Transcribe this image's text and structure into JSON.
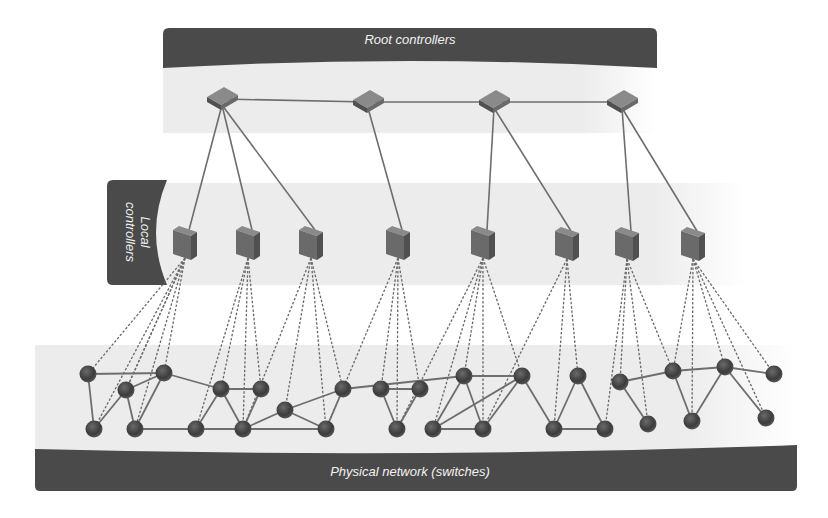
{
  "diagram": {
    "colors": {
      "band_dark": "#4a4a4a",
      "band_light": "#e9e9e9",
      "device_body": "#6a6a6a",
      "device_top": "#8a8a8a",
      "device_side": "#505050",
      "switch_fill": "#3f3f3f",
      "link_solid": "#6e6e6e",
      "link_dashed": "#6a6a6a",
      "label_text": "#f2f2f2"
    },
    "layers": {
      "root": {
        "label": "Root controllers",
        "band": {
          "x": 163,
          "y": 28,
          "w": 494,
          "h": 40
        },
        "area": {
          "x": 163,
          "y": 58,
          "w": 494,
          "h": 75
        },
        "nodes": [
          {
            "id": "r1",
            "x": 222,
            "y": 99
          },
          {
            "id": "r2",
            "x": 368,
            "y": 102
          },
          {
            "id": "r3",
            "x": 494,
            "y": 102
          },
          {
            "id": "r4",
            "x": 622,
            "y": 102
          }
        ]
      },
      "local": {
        "label_line1": "Local",
        "label_line2": "controllers",
        "band": {
          "x": 107,
          "y": 180,
          "w": 60,
          "h": 105
        },
        "area": {
          "x": 150,
          "y": 183,
          "w": 594,
          "h": 102
        },
        "nodes": [
          {
            "id": "l1",
            "x": 185,
            "y": 244
          },
          {
            "id": "l2",
            "x": 248,
            "y": 244
          },
          {
            "id": "l3",
            "x": 311,
            "y": 244
          },
          {
            "id": "l4",
            "x": 398,
            "y": 244
          },
          {
            "id": "l5",
            "x": 483,
            "y": 244
          },
          {
            "id": "l6",
            "x": 567,
            "y": 245
          },
          {
            "id": "l7",
            "x": 627,
            "y": 245
          },
          {
            "id": "l8",
            "x": 693,
            "y": 245
          }
        ]
      },
      "physical": {
        "label": "Physical network (switches)",
        "band": {
          "x": 35,
          "y": 445,
          "w": 762,
          "h": 46
        },
        "area": {
          "x": 35,
          "y": 345,
          "w": 762,
          "h": 110
        },
        "nodes": [
          {
            "id": "s1",
            "x": 88,
            "y": 374
          },
          {
            "id": "s2",
            "x": 126,
            "y": 390
          },
          {
            "id": "s3",
            "x": 164,
            "y": 373
          },
          {
            "id": "s4",
            "x": 94,
            "y": 429
          },
          {
            "id": "s5",
            "x": 135,
            "y": 429
          },
          {
            "id": "s6",
            "x": 221,
            "y": 389
          },
          {
            "id": "s7",
            "x": 261,
            "y": 389
          },
          {
            "id": "s8",
            "x": 196,
            "y": 429
          },
          {
            "id": "s9",
            "x": 243,
            "y": 429
          },
          {
            "id": "s10",
            "x": 285,
            "y": 410
          },
          {
            "id": "s11",
            "x": 343,
            "y": 389
          },
          {
            "id": "s12",
            "x": 326,
            "y": 429
          },
          {
            "id": "s13",
            "x": 381,
            "y": 389
          },
          {
            "id": "s14",
            "x": 420,
            "y": 389
          },
          {
            "id": "s15",
            "x": 397,
            "y": 429
          },
          {
            "id": "s16",
            "x": 464,
            "y": 376
          },
          {
            "id": "s17",
            "x": 522,
            "y": 376
          },
          {
            "id": "s18",
            "x": 433,
            "y": 429
          },
          {
            "id": "s19",
            "x": 483,
            "y": 429
          },
          {
            "id": "s20",
            "x": 578,
            "y": 376
          },
          {
            "id": "s21",
            "x": 554,
            "y": 429
          },
          {
            "id": "s22",
            "x": 620,
            "y": 382
          },
          {
            "id": "s23",
            "x": 605,
            "y": 429
          },
          {
            "id": "s24",
            "x": 648,
            "y": 424
          },
          {
            "id": "s25",
            "x": 673,
            "y": 371
          },
          {
            "id": "s26",
            "x": 725,
            "y": 367
          },
          {
            "id": "s27",
            "x": 774,
            "y": 374
          },
          {
            "id": "s28",
            "x": 692,
            "y": 421
          },
          {
            "id": "s29",
            "x": 766,
            "y": 418
          }
        ]
      }
    },
    "links": {
      "root_peer": [
        [
          "r1",
          "r2"
        ],
        [
          "r2",
          "r3"
        ],
        [
          "r3",
          "r4"
        ]
      ],
      "root_to_local": [
        [
          "r1",
          "l1"
        ],
        [
          "r1",
          "l2"
        ],
        [
          "r1",
          "l3"
        ],
        [
          "r2",
          "l4"
        ],
        [
          "r3",
          "l5"
        ],
        [
          "r3",
          "l6"
        ],
        [
          "r4",
          "l7"
        ],
        [
          "r4",
          "l8"
        ]
      ],
      "control_dashed": [
        [
          "l1",
          "s1"
        ],
        [
          "l1",
          "s2"
        ],
        [
          "l1",
          "s3"
        ],
        [
          "l1",
          "s4"
        ],
        [
          "l1",
          "s5"
        ],
        [
          "l1",
          "s2"
        ],
        [
          "l2",
          "s6"
        ],
        [
          "l2",
          "s7"
        ],
        [
          "l2",
          "s8"
        ],
        [
          "l2",
          "s9"
        ],
        [
          "l3",
          "s10"
        ],
        [
          "l3",
          "s11"
        ],
        [
          "l3",
          "s12"
        ],
        [
          "l3",
          "s9"
        ],
        [
          "l4",
          "s13"
        ],
        [
          "l4",
          "s14"
        ],
        [
          "l4",
          "s15"
        ],
        [
          "l4",
          "s12"
        ],
        [
          "l5",
          "s16"
        ],
        [
          "l5",
          "s17"
        ],
        [
          "l5",
          "s18"
        ],
        [
          "l5",
          "s19"
        ],
        [
          "l5",
          "s15"
        ],
        [
          "l6",
          "s20"
        ],
        [
          "l6",
          "s21"
        ],
        [
          "l6",
          "s19"
        ],
        [
          "l7",
          "s22"
        ],
        [
          "l7",
          "s23"
        ],
        [
          "l7",
          "s24"
        ],
        [
          "l7",
          "s25"
        ],
        [
          "l8",
          "s26"
        ],
        [
          "l8",
          "s27"
        ],
        [
          "l8",
          "s28"
        ],
        [
          "l8",
          "s29"
        ],
        [
          "l8",
          "s25"
        ]
      ],
      "physical_solid": [
        [
          "s1",
          "s3"
        ],
        [
          "s1",
          "s4"
        ],
        [
          "s2",
          "s3"
        ],
        [
          "s2",
          "s4"
        ],
        [
          "s2",
          "s5"
        ],
        [
          "s3",
          "s5"
        ],
        [
          "s3",
          "s6"
        ],
        [
          "s6",
          "s7"
        ],
        [
          "s6",
          "s8"
        ],
        [
          "s6",
          "s9"
        ],
        [
          "s7",
          "s9"
        ],
        [
          "s5",
          "s8"
        ],
        [
          "s8",
          "s9"
        ],
        [
          "s9",
          "s10"
        ],
        [
          "s9",
          "s12"
        ],
        [
          "s10",
          "s11"
        ],
        [
          "s10",
          "s12"
        ],
        [
          "s11",
          "s12"
        ],
        [
          "s11",
          "s16"
        ],
        [
          "s13",
          "s14"
        ],
        [
          "s13",
          "s15"
        ],
        [
          "s14",
          "s15"
        ],
        [
          "s16",
          "s17"
        ],
        [
          "s16",
          "s18"
        ],
        [
          "s16",
          "s19"
        ],
        [
          "s17",
          "s18"
        ],
        [
          "s17",
          "s19"
        ],
        [
          "s18",
          "s19"
        ],
        [
          "s17",
          "s21"
        ],
        [
          "s20",
          "s21"
        ],
        [
          "s20",
          "s23"
        ],
        [
          "s21",
          "s23"
        ],
        [
          "s22",
          "s24"
        ],
        [
          "s22",
          "s25"
        ],
        [
          "s25",
          "s26"
        ],
        [
          "s26",
          "s27"
        ],
        [
          "s25",
          "s28"
        ],
        [
          "s26",
          "s28"
        ],
        [
          "s26",
          "s29"
        ]
      ]
    }
  }
}
